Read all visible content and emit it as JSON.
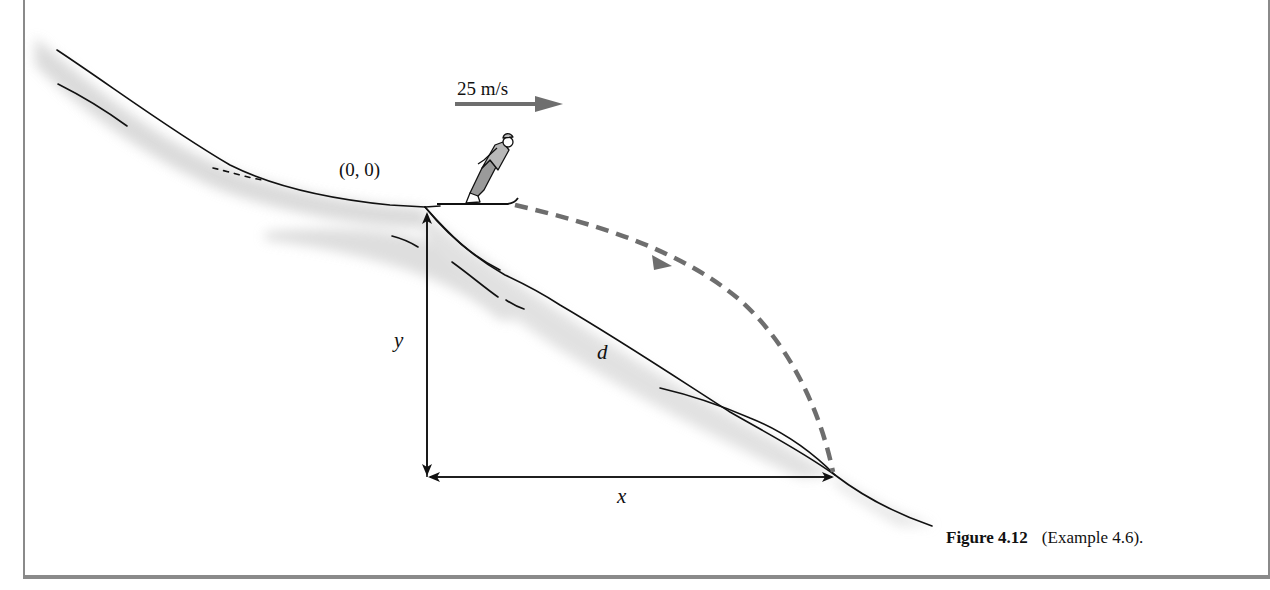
{
  "figure": {
    "caption_number": "Figure 4.12",
    "caption_text": "(Example 4.6)."
  },
  "labels": {
    "velocity": "25 m/s",
    "origin": "(0, 0)",
    "vertical_drop": "y",
    "horizontal_distance": "x",
    "slope_distance": "d"
  },
  "colors": {
    "line": "#111111",
    "trajectory": "#6e6e6e",
    "velocity_arrow": "#6e6e6e",
    "snow_shade": "#d6d6d6",
    "frame": "#8a8a8a"
  },
  "elements": {
    "skier": "ski-jumper-figure",
    "trajectory": "dashed-parabolic-path",
    "velocity_arrow": "right-arrow"
  }
}
